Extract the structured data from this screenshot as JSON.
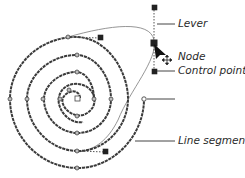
{
  "diagram": {
    "type": "bezier-path-anatomy",
    "labels": {
      "lever": "Lever",
      "node": "Node",
      "control_point": "Control point",
      "line_segment": "Line segment"
    },
    "colors": {
      "stroke": "#3a3a3a",
      "guide": "#8a8a8a",
      "node_fill": "#bdbdbd",
      "control_point": "#222222",
      "background": "#ffffff"
    }
  }
}
